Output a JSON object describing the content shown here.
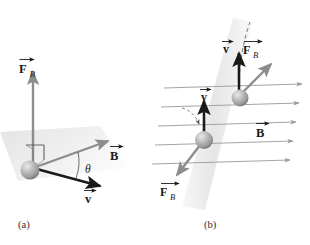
{
  "figure": {
    "title_visible": false,
    "background_color": "#ffffff",
    "panels": [
      {
        "id": "a",
        "tag": "(a)",
        "description": "Single charged particle with velocity v at angle theta to magnetic field B, magnetic force F_B perpendicular to the v-B plane",
        "plane_fill": "#eeeeee",
        "labels": [
          {
            "name": "force-label-a",
            "symbol": "F",
            "subscript": "B",
            "vector": true,
            "color": "#1a1a1a"
          },
          {
            "name": "field-label-a",
            "symbol": "B",
            "subscript": "",
            "vector": true,
            "color": "#1a1a1a"
          },
          {
            "name": "velocity-label-a",
            "symbol": "v",
            "subscript": "",
            "vector": true,
            "color": "#1a1a1a"
          },
          {
            "name": "angle-label-a",
            "symbol": "θ",
            "subscript": "",
            "vector": false,
            "color": "#1a1a1a"
          }
        ],
        "vectors": [
          {
            "name": "force-vector-a",
            "label": "F_B",
            "direction": "up",
            "color": "#8c8c8c"
          },
          {
            "name": "field-vector-a",
            "label": "B",
            "direction": "up-right",
            "color": "#8c8c8c"
          },
          {
            "name": "velocity-vector-a",
            "label": "v",
            "direction": "down-right",
            "color": "#1a1a1a"
          }
        ],
        "right_angle_marker": true,
        "angle_arc_label": "θ"
      },
      {
        "id": "b",
        "tag": "(b)",
        "description": "Two charged particles moving upward in a uniform magnetic field pointing right; magnetic force directions differ by charge sign, dashed curved trajectories shown",
        "band_fill": "#ededed",
        "field_line_count": 5,
        "field_line_color": "#9a9a9a",
        "field_line_direction": "right",
        "labels": [
          {
            "name": "field-label-b",
            "symbol": "B",
            "subscript": "",
            "vector": true,
            "color": "#1a1a1a"
          },
          {
            "name": "velocity-label-b-upper",
            "symbol": "v",
            "subscript": "",
            "vector": true,
            "color": "#1a1a1a"
          },
          {
            "name": "force-label-b-upper",
            "symbol": "F",
            "subscript": "B",
            "vector": true,
            "color": "#1a1a1a"
          },
          {
            "name": "velocity-label-b-lower",
            "symbol": "v",
            "subscript": "",
            "vector": true,
            "color": "#1a1a1a"
          },
          {
            "name": "force-label-b-lower",
            "symbol": "F",
            "subscript": "B",
            "vector": true,
            "color": "#1a1a1a"
          }
        ],
        "particles": [
          {
            "name": "particle-upper",
            "velocity_direction": "up",
            "force_direction": "up-right",
            "trajectory": "dashed-curve-up"
          },
          {
            "name": "particle-lower",
            "velocity_direction": "up",
            "force_direction": "down-left",
            "trajectory": "dashed-arc-left"
          }
        ]
      }
    ],
    "colors": {
      "vector_black": "#1a1a1a",
      "vector_gray": "#8c8c8c",
      "field_line_gray": "#9a9a9a",
      "sphere_light": "#d8d8d8",
      "sphere_mid": "#a8a8a8",
      "sphere_dark": "#6e6e6e",
      "plane_gray": "#ebebeb",
      "band_gray": "#ededed",
      "label_text": "#1a1a1a",
      "tag_text": "#303030"
    }
  }
}
